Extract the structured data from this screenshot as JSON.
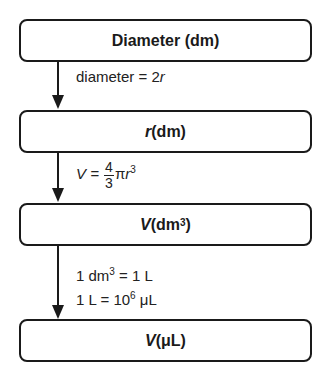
{
  "heading_cutoff": "•",
  "boxes": [
    {
      "label": "Diameter (dm)"
    },
    {
      "var": "r",
      "unit": " (dm)"
    },
    {
      "var": "V",
      "unit_pre": " (dm",
      "unit_sup": "3",
      "unit_post": ")"
    },
    {
      "var": "V",
      "unit": " (μL)"
    }
  ],
  "steps": [
    {
      "text": "diameter = 2",
      "var": "r"
    },
    {
      "lhs": "V = ",
      "num": "4",
      "den": "3",
      "rest": "π",
      "var": "r",
      "sup": "3"
    },
    {
      "line1_pre": "1 dm",
      "line1_sup": "3",
      "line1_post": " = 1 L",
      "line2_pre": "1 L = 10",
      "line2_sup": "6",
      "line2_post": " μL"
    }
  ],
  "icons": {
    "arrow": "down-arrow-icon"
  }
}
